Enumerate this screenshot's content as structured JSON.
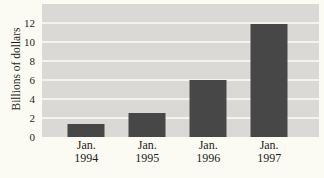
{
  "chart_data": {
    "type": "bar",
    "title": "",
    "xlabel": "",
    "ylabel": "Billions of dollars",
    "categories": [
      {
        "line1": "Jan.",
        "line2": "1994"
      },
      {
        "line1": "Jan.",
        "line2": "1995"
      },
      {
        "line1": "Jan.",
        "line2": "1996"
      },
      {
        "line1": "Jan.",
        "line2": "1997"
      }
    ],
    "values": [
      1.4,
      2.5,
      6.0,
      11.9
    ],
    "yticks": [
      0,
      2,
      4,
      6,
      8,
      10,
      12
    ],
    "gridline_values": [
      2,
      4,
      6,
      8,
      10,
      12
    ],
    "ylim": [
      0,
      14
    ],
    "grid": true,
    "legend": "none",
    "colors": {
      "bar": "#474747",
      "plot_bg": "#dad9d5",
      "gridline": "#f4f3ef",
      "page_bg": "#fcfbf3",
      "text": "#1b1b1b"
    }
  }
}
